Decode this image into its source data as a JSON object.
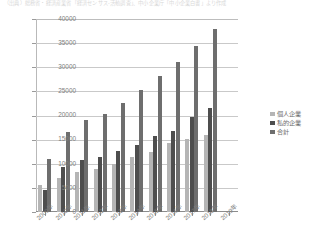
{
  "caption": {
    "text": "（出典）総務省・経済産業省「経済センサス‐活動調査」、中小企業庁「中小企業白書」より作成"
  },
  "legend": {
    "position": "right",
    "entries": [
      {
        "label": "個人企業",
        "color": "#b5b5b5"
      },
      {
        "label": "私的企業",
        "color": "#4e4e4e"
      },
      {
        "label": "合計",
        "color": "#6e6e6e"
      }
    ]
  },
  "axes": {
    "y_ticks": [
      "0",
      "5000",
      "10000",
      "15000",
      "20000",
      "25000",
      "30000",
      "35000",
      "40000"
    ],
    "x_ticks": [
      "2009年",
      "2010年",
      "2011年",
      "2012年",
      "2013年",
      "2014年",
      "2015年",
      "2016年",
      "2017年",
      "2018年",
      "2019年"
    ]
  },
  "chart_data": {
    "type": "bar",
    "title": "",
    "xlabel": "",
    "ylabel": "",
    "ylim": [
      0,
      40000
    ],
    "ytick_step": 5000,
    "grid": true,
    "legend_position": "right",
    "categories": [
      "2009年",
      "2010年",
      "2011年",
      "2012年",
      "2013年",
      "2014年",
      "2015年",
      "2016年",
      "2017年",
      "2018年",
      "2019年"
    ],
    "series": [
      {
        "name": "個人企業",
        "color": "#b5b5b5",
        "values": [
          5500,
          7000,
          8300,
          9000,
          10000,
          11300,
          12500,
          14300,
          15200,
          16000,
          null
        ]
      },
      {
        "name": "私的企業",
        "color": "#4e4e4e",
        "values": [
          4600,
          9300,
          10700,
          11500,
          12700,
          13800,
          15700,
          16800,
          19600,
          21500,
          null
        ]
      },
      {
        "name": "合計",
        "color": "#6e6e6e",
        "values": [
          11000,
          16500,
          19000,
          20300,
          22600,
          25200,
          28200,
          31000,
          34500,
          38000,
          null
        ]
      }
    ]
  }
}
